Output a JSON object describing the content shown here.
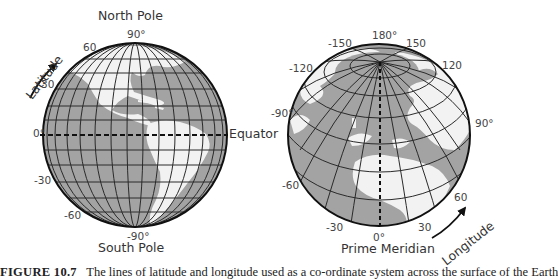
{
  "left_globe": {
    "title_top": "North Pole",
    "title_bottom": "South Pole",
    "equator_label": "Equator",
    "axis_label": "Latitude",
    "ticks": {
      "lat_90": "90°",
      "lat_60": "60",
      "lat_30": "30",
      "lat_0": "0°",
      "lat_m30": "-30",
      "lat_m60": "-60",
      "lat_m90": "-90°"
    }
  },
  "right_globe": {
    "title_bottom": "Prime Meridian",
    "axis_label": "Longitude",
    "ticks": {
      "lon_180": "180°",
      "lon_m150": "-150",
      "lon_150": "150",
      "lon_m120": "-120",
      "lon_120": "120",
      "lon_m90": "-90°",
      "lon_90": "90°",
      "lon_m60": "-60",
      "lon_60": "60",
      "lon_m30": "-30",
      "lon_30": "30",
      "lon_0": "0°"
    }
  },
  "colors": {
    "ocean": "#a3a3a3",
    "land": "#f2f2f2",
    "grid": "#2a2a2a",
    "outline": "#111111"
  },
  "caption": {
    "figure_label": "FIGURE 10.7",
    "text": "The lines of latitude and longitude used as a co-ordinate system across the surface of the Earth"
  }
}
